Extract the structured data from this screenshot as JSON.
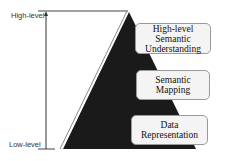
{
  "axis": {
    "top_label": "High-level",
    "bottom_label": "Low-level"
  },
  "levels": [
    {
      "line1": "High-level",
      "line2": "Semantic",
      "line3": "Understanding"
    },
    {
      "line1": "Semantic",
      "line2": "Mapping"
    },
    {
      "line1": "Data",
      "line2": "Representation"
    }
  ],
  "colors": {
    "pyramid_fill": "#1a1a1a",
    "box_fill": "#f4f4f4",
    "box_border": "#9a9a9a",
    "axis_line": "#333333"
  }
}
